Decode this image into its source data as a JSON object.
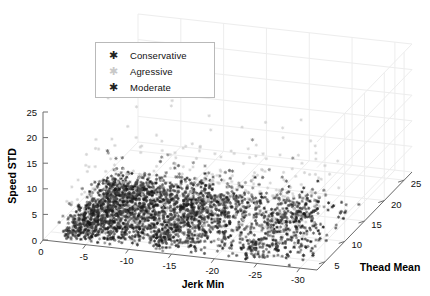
{
  "chart_data": {
    "type": "scatter",
    "title": "",
    "projection": "3d",
    "xlabel": "Jerk Min",
    "ylabel": "Speed STD",
    "zlabel": "Thead Mean",
    "xticks": [
      "0",
      "-5",
      "-10",
      "-15",
      "-20",
      "-25",
      "-30"
    ],
    "xtickvalues": [
      0,
      -5,
      -10,
      -15,
      -20,
      -25,
      -30
    ],
    "yticks": [
      "0",
      "5",
      "10",
      "15",
      "20",
      "25"
    ],
    "ytickvalues": [
      0,
      5,
      10,
      15,
      20,
      25
    ],
    "zticks": [
      "5",
      "10",
      "15",
      "20",
      "25"
    ],
    "ztickvalues": [
      5,
      10,
      15,
      20,
      25
    ],
    "xlim": [
      0,
      -32
    ],
    "ylim": [
      0,
      25
    ],
    "zlim": [
      3,
      27
    ],
    "grid": true,
    "legend_position": "upper-left",
    "series": [
      {
        "name": "Conservative",
        "marker": "asterisk",
        "color": "#1a1a1a",
        "description": "dense dark cluster at low Speed STD spanning Jerk Min -2 to -28"
      },
      {
        "name": "Agressive",
        "marker": "asterisk",
        "color": "#c9c9c9",
        "description": "sparse light points scattered at high Speed STD 5 to 24"
      },
      {
        "name": "Moderate",
        "marker": "asterisk",
        "color": "#4a4a4a",
        "description": "mid-tone points mixed within the main cluster"
      }
    ]
  },
  "legend": {
    "items": [
      {
        "label": "Conservative",
        "glyph": "✱",
        "tone": "dark"
      },
      {
        "label": "Agressive",
        "glyph": "✱",
        "tone": "faint"
      },
      {
        "label": "Moderate",
        "glyph": "✱",
        "tone": "dark"
      }
    ]
  },
  "axes": {
    "x_label": "Jerk Min",
    "y_label": "Speed STD",
    "z_label": "Thead Mean"
  }
}
